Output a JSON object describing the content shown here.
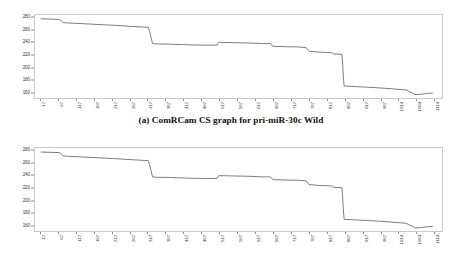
{
  "figures": [
    {
      "id": "a",
      "caption": "(a) ComRCam CS graph for pri-miR-30c Wild"
    },
    {
      "id": "b",
      "caption": "(b) ComRCam CS graph for pri-miR-30c G27A"
    }
  ],
  "chart_data": [
    {
      "type": "line",
      "title": "(a) ComRCam CS graph for pri-miR-30c Wild",
      "xlabel": "",
      "ylabel": "",
      "ylim": [
        150,
        285
      ],
      "xlim": [
        1,
        1140
      ],
      "grid": false,
      "legend": "none",
      "line_color": "#6e6e6e",
      "ytick_labels": [
        "280",
        "260",
        "240",
        "220",
        "200",
        "180",
        "160"
      ],
      "ytick_values": [
        280,
        260,
        240,
        220,
        200,
        180,
        160
      ],
      "xtick_labels": [
        "17",
        "67",
        "117",
        "167",
        "217",
        "267",
        "317",
        "367",
        "417",
        "467",
        "517",
        "567",
        "617",
        "667",
        "717",
        "767",
        "817",
        "867",
        "917",
        "967",
        "1014",
        "1064",
        "1114"
      ],
      "xtick_values": [
        17,
        67,
        117,
        167,
        217,
        267,
        317,
        367,
        417,
        467,
        517,
        567,
        617,
        667,
        717,
        767,
        817,
        867,
        917,
        967,
        1014,
        1064,
        1114
      ],
      "x": [
        17,
        40,
        70,
        80,
        95,
        130,
        180,
        230,
        270,
        300,
        318,
        322,
        326,
        330,
        340,
        380,
        430,
        470,
        510,
        514,
        518,
        560,
        600,
        620,
        640,
        660,
        664,
        668,
        700,
        740,
        760,
        764,
        768,
        800,
        830,
        834,
        838,
        860,
        862,
        864,
        866,
        900,
        950,
        1000,
        1040,
        1060,
        1064,
        1080,
        1100,
        1114
      ],
      "y": [
        279,
        278.5,
        277.8,
        272.5,
        272,
        271,
        269.5,
        268,
        266.5,
        265.5,
        265,
        258,
        248,
        238.5,
        238,
        237.5,
        236.5,
        236,
        236,
        240,
        240.5,
        240,
        239.5,
        239,
        238.5,
        238.5,
        235.5,
        234,
        233.5,
        233,
        232,
        228.5,
        226,
        224.5,
        224,
        222.5,
        221.5,
        221,
        205,
        185,
        169.5,
        168.5,
        167,
        165,
        163,
        157,
        155.5,
        156,
        157.5,
        158
      ],
      "notable_features": [
        "Initial plateau near 279 dropping to ~272",
        "Gradual decline to ~265 near x=318",
        "Sharp step down to ~238 between x=318 and x=330",
        "Plateau around 236-240 across mid-range",
        "Step down to ~221 around x=838",
        "Large vertical drop from ~221 to ~169 near x=862-866",
        "Slow decline to minimum ~155 near x=1064 with slight uptick to ~158 at x=1114"
      ]
    },
    {
      "type": "line",
      "title": "(b) ComRCam CS graph for pri-miR-30c G27A",
      "xlabel": "",
      "ylabel": "",
      "ylim": [
        150,
        285
      ],
      "xlim": [
        1,
        1140
      ],
      "grid": false,
      "legend": "none",
      "line_color": "#6e6e6e",
      "ytick_labels": [
        "280",
        "260",
        "240",
        "220",
        "200",
        "180",
        "160"
      ],
      "ytick_values": [
        280,
        260,
        240,
        220,
        200,
        180,
        160
      ],
      "xtick_labels": [
        "17",
        "67",
        "117",
        "167",
        "217",
        "267",
        "317",
        "367",
        "417",
        "467",
        "517",
        "567",
        "617",
        "667",
        "717",
        "767",
        "817",
        "867",
        "917",
        "967",
        "1014",
        "1064",
        "1114"
      ],
      "xtick_values": [
        17,
        67,
        117,
        167,
        217,
        267,
        317,
        367,
        417,
        467,
        517,
        567,
        617,
        667,
        717,
        767,
        817,
        867,
        917,
        967,
        1014,
        1064,
        1114
      ],
      "x": [
        17,
        40,
        70,
        80,
        95,
        130,
        180,
        230,
        270,
        300,
        318,
        322,
        326,
        330,
        340,
        380,
        430,
        470,
        510,
        514,
        518,
        560,
        600,
        620,
        640,
        660,
        664,
        668,
        700,
        740,
        760,
        764,
        768,
        800,
        830,
        834,
        838,
        860,
        862,
        864,
        866,
        900,
        950,
        1000,
        1040,
        1060,
        1064,
        1080,
        1100,
        1114
      ],
      "y": [
        278.5,
        278,
        277.5,
        272,
        271.5,
        270.5,
        269,
        267.5,
        266,
        265,
        264.5,
        257,
        247,
        238,
        237.5,
        237,
        236,
        235.5,
        235.5,
        239.5,
        240,
        239.5,
        239,
        238.5,
        238,
        238,
        235,
        233.5,
        233,
        232.5,
        231.5,
        228,
        225.5,
        224,
        223.5,
        222,
        221,
        220.5,
        204.5,
        184.5,
        169,
        168,
        166.5,
        164.5,
        162.5,
        156.5,
        155,
        155.5,
        157,
        157.5
      ],
      "notable_features": [
        "Initial plateau near 278.5 dropping to ~272",
        "Gradual decline to ~264.5 near x=318",
        "Sharp step down to ~238 between x=318 and x=330",
        "Plateau around 235-240 across mid-range",
        "Step down to ~221 around x=838",
        "Large vertical drop from ~220 to ~169 near x=862-866",
        "Slow decline to minimum ~155 near x=1064 with slight uptick to ~157.5 at x=1114"
      ]
    }
  ]
}
